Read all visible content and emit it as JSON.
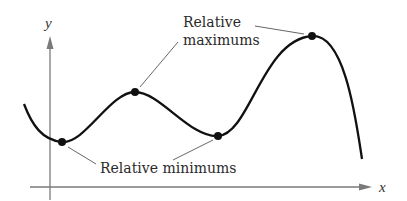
{
  "diagram": {
    "axes": {
      "x_label": "x",
      "y_label": "y",
      "axis_color": "#7a7a7a"
    },
    "curve": {
      "color": "#111111",
      "path": "M24,104 C32,125 42,140 62,142 C85,144 110,92 135,92 C160,92 190,138 218,136 C250,134 262,40 312,36 C345,34 356,120 362,159"
    },
    "points": [
      {
        "name": "relative-minimum-1",
        "x": 62,
        "y": 142
      },
      {
        "name": "relative-maximum-1",
        "x": 135,
        "y": 92
      },
      {
        "name": "relative-minimum-2",
        "x": 218,
        "y": 136
      },
      {
        "name": "relative-maximum-2",
        "x": 312,
        "y": 36
      }
    ],
    "annotations": {
      "maximums": {
        "line1": "Relative",
        "line2": "maximums"
      },
      "minimums": {
        "text": "Relative minimums"
      }
    }
  }
}
